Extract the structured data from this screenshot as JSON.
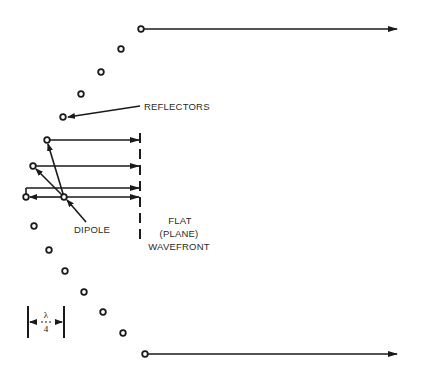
{
  "diagram": {
    "labels": {
      "reflectors": "REFLECTORS",
      "dipole": "DIPOLE",
      "wavefront_line1": "FLAT",
      "wavefront_line2": "(PLANE)",
      "wavefront_line3": "WAVEFRONT",
      "lambda_num": "λ",
      "lambda_den": "4"
    },
    "colors": {
      "ink": "#1a1a1a",
      "background": "#ffffff"
    },
    "reflector_elements_upper": [
      {
        "x": 141,
        "y": 29
      },
      {
        "x": 121,
        "y": 49
      },
      {
        "x": 101,
        "y": 72
      },
      {
        "x": 81,
        "y": 94
      },
      {
        "x": 63,
        "y": 117
      },
      {
        "x": 47,
        "y": 140
      },
      {
        "x": 33,
        "y": 166
      },
      {
        "x": 26,
        "y": 197
      }
    ],
    "reflector_elements_lower": [
      {
        "x": 34,
        "y": 226
      },
      {
        "x": 49,
        "y": 250
      },
      {
        "x": 65,
        "y": 271
      },
      {
        "x": 84,
        "y": 292
      },
      {
        "x": 103,
        "y": 312
      },
      {
        "x": 123,
        "y": 333
      },
      {
        "x": 145,
        "y": 354
      }
    ],
    "dipole": {
      "x": 64,
      "y": 197
    },
    "wavefront_x": 140,
    "spacing_marker": "λ/4"
  }
}
